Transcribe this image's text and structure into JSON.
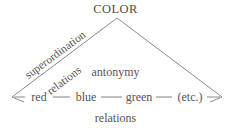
{
  "diagram": {
    "type": "semantic-relations-triangle",
    "apex": {
      "label": "COLOR"
    },
    "left_edge": {
      "line1": "superordination",
      "line2": "relations"
    },
    "interior": {
      "label": "antonymy"
    },
    "bottom_caption": {
      "label": "relations"
    },
    "nodes": [
      {
        "label": "red"
      },
      {
        "label": "blue"
      },
      {
        "label": "green"
      },
      {
        "label": "(etc.)"
      }
    ],
    "colors": {
      "line": "#8d8a86",
      "text": "#55524f",
      "background": "#ffffff"
    }
  }
}
